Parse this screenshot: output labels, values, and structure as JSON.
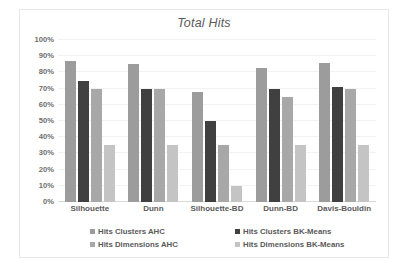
{
  "chart_data": {
    "type": "bar",
    "title": "Total Hits",
    "xlabel": "",
    "ylabel": "",
    "ylim": [
      0,
      100
    ],
    "ytick_labels": [
      "100%",
      "90%",
      "80%",
      "70%",
      "60%",
      "50%",
      "40%",
      "30%",
      "20%",
      "10%",
      "0%"
    ],
    "ytick_values": [
      100,
      90,
      80,
      70,
      60,
      50,
      40,
      30,
      20,
      10,
      0
    ],
    "grid": true,
    "legend_position": "bottom",
    "categories": [
      "Silhouette",
      "Dunn",
      "Silhouette-BD",
      "Dunn-BD",
      "Davis-Bouldin"
    ],
    "series": [
      {
        "name": "Hits Clusters AHC",
        "color": "#9c9c9c",
        "values": [
          87,
          85,
          68,
          83,
          86
        ]
      },
      {
        "name": "Hits Clusters BK-Means",
        "color": "#404040",
        "values": [
          75,
          70,
          50,
          70,
          71
        ]
      },
      {
        "name": "Hits Dimensions AHC",
        "color": "#a8a8a8",
        "values": [
          70,
          70,
          35,
          65,
          70
        ]
      },
      {
        "name": "Hits Dimensions BK-Means",
        "color": "#c4c4c4",
        "values": [
          35,
          35,
          10,
          35,
          35
        ]
      }
    ]
  }
}
